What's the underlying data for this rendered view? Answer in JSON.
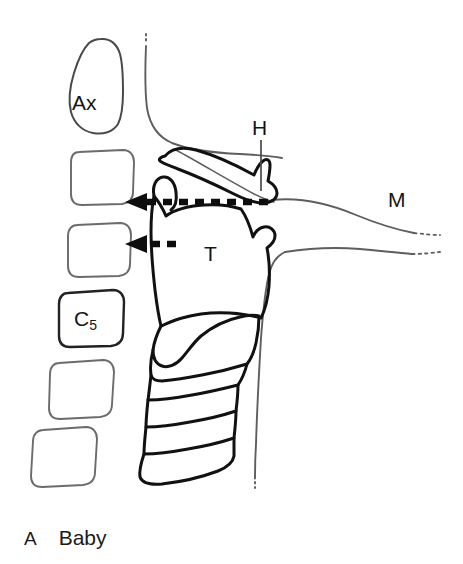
{
  "figure": {
    "caption_letter": "A",
    "caption_title": "Baby",
    "background_color": "#ffffff",
    "ink_color": "#151515",
    "faint_ink_color": "#6a6a6a",
    "width": 463,
    "height": 564
  },
  "labels": {
    "axis_vertebra": "Ax",
    "cervical_five_base": "C",
    "cervical_five_subscript": "5",
    "hyoid": "H",
    "thyroid_cartilage": "T",
    "mandible": "M"
  },
  "annotations": {
    "upper_arrow": {
      "name": "hyoid-to-vertebra-measurement",
      "style": "dashed",
      "direction": "left",
      "x_start": 268,
      "x_end": 128,
      "y": 202
    },
    "lower_arrow": {
      "name": "thyroid-to-vertebra-measurement",
      "style": "dashed",
      "direction": "left",
      "x_start": 176,
      "x_end": 128,
      "y": 244
    },
    "hyoid_leader_line": {
      "name": "hyoid-leader",
      "x": 261,
      "y_start": 140,
      "y_end": 190
    }
  },
  "structures": [
    {
      "id": "axis-vertebra",
      "label": "Ax",
      "type": "bone-outline"
    },
    {
      "id": "cervical-vertebra-c3",
      "label": "",
      "type": "bone-outline"
    },
    {
      "id": "cervical-vertebra-c4",
      "label": "",
      "type": "bone-outline"
    },
    {
      "id": "cervical-vertebra-c5",
      "label": "C5",
      "type": "bone-outline"
    },
    {
      "id": "cervical-vertebra-c6",
      "label": "",
      "type": "bone-outline"
    },
    {
      "id": "cervical-vertebra-c7",
      "label": "",
      "type": "bone-outline"
    },
    {
      "id": "hyoid-bone",
      "label": "H",
      "type": "bone-outline"
    },
    {
      "id": "thyroid-cartilage",
      "label": "T",
      "type": "cartilage-outline"
    },
    {
      "id": "cricoid-cartilage",
      "label": "",
      "type": "cartilage-outline"
    },
    {
      "id": "tracheal-rings",
      "label": "",
      "type": "cartilage-outline"
    },
    {
      "id": "mandible",
      "label": "M",
      "type": "soft-outline"
    },
    {
      "id": "pharyngeal-wall",
      "label": "",
      "type": "soft-outline"
    },
    {
      "id": "anterior-neck-skin",
      "label": "",
      "type": "soft-outline"
    }
  ]
}
